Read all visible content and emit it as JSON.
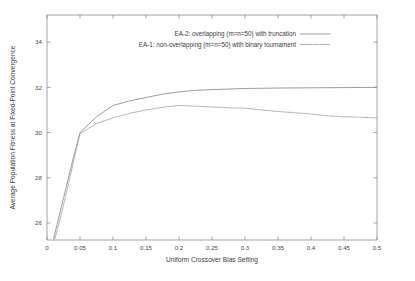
{
  "chart_data": {
    "type": "line",
    "title": "",
    "xlabel": "Uniform Crossover Bias Setting",
    "ylabel": "Average Population Fitness at Fixed-Point Convergence",
    "xlim": [
      0,
      0.5
    ],
    "ylim": [
      25.25,
      35.2
    ],
    "grid": false,
    "legend_position": "top-center",
    "xticks": [
      "0",
      "0.05",
      "0.1",
      "0.15",
      "0.2",
      "0.25",
      "0.3",
      "0.35",
      "0.4",
      "0.45",
      "0.5"
    ],
    "xtick_values": [
      0,
      0.05,
      0.1,
      0.15,
      0.2,
      0.25,
      0.3,
      0.35,
      0.4,
      0.45,
      0.5
    ],
    "yticks": [
      "26",
      "28",
      "30",
      "32",
      "34"
    ],
    "ytick_values": [
      26,
      28,
      30,
      32,
      34
    ],
    "series": [
      {
        "name": "EA-2: overlapping (m=n=50) with truncation",
        "style": "solid",
        "color": "#8a8a96",
        "x": [
          0.01,
          0.02,
          0.03,
          0.04,
          0.05,
          0.075,
          0.1,
          0.125,
          0.15,
          0.175,
          0.2,
          0.225,
          0.25,
          0.3,
          0.35,
          0.4,
          0.45,
          0.5
        ],
        "values": [
          25.3,
          26.5,
          27.7,
          28.9,
          30.0,
          30.7,
          31.2,
          31.4,
          31.55,
          31.7,
          31.8,
          31.87,
          31.9,
          31.95,
          31.97,
          31.98,
          31.99,
          32.0
        ]
      },
      {
        "name": "EA-1: non-overlapping (m=n=50) with binary tournament",
        "style": "dotted",
        "color": "#9a9aa6",
        "x": [
          0.012,
          0.02,
          0.03,
          0.04,
          0.05,
          0.075,
          0.1,
          0.125,
          0.15,
          0.175,
          0.2,
          0.225,
          0.25,
          0.275,
          0.3,
          0.325,
          0.35,
          0.375,
          0.4,
          0.425,
          0.45,
          0.475,
          0.5
        ],
        "values": [
          25.3,
          26.2,
          27.4,
          28.7,
          29.95,
          30.4,
          30.65,
          30.85,
          31.0,
          31.12,
          31.2,
          31.17,
          31.13,
          31.1,
          31.08,
          31.0,
          30.93,
          30.88,
          30.82,
          30.74,
          30.7,
          30.68,
          30.65
        ]
      }
    ]
  },
  "legend": {
    "entries": [
      {
        "label": "EA-2: overlapping (m=n=50) with truncation",
        "style": "solid"
      },
      {
        "label": "EA-1: non-overlapping (m=n=50) with binary tournament",
        "style": "dotted"
      }
    ]
  }
}
